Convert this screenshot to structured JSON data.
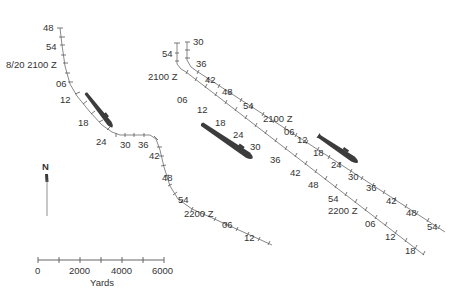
{
  "diagram": {
    "type": "navigation-track-chart",
    "compass": {
      "label": "N"
    },
    "scale_bar": {
      "ticks": [
        0,
        1000,
        2000,
        3000,
        4000,
        5000,
        6000
      ],
      "labels": [
        "0",
        "2000",
        "4000",
        "6000"
      ],
      "unit": "Yards"
    },
    "tracks": [
      {
        "id": "track-west",
        "labels": [
          "48",
          "54",
          "8/20 2100 Z",
          "06",
          "12",
          "18",
          "24",
          "30",
          "36",
          "42",
          "48",
          "54",
          "2200 Z",
          "06",
          "12"
        ]
      },
      {
        "id": "track-east-outer",
        "labels": [
          "54",
          "2100 Z",
          "06",
          "12",
          "18",
          "24",
          "30",
          "36",
          "42",
          "48",
          "54",
          "2200 Z",
          "06",
          "12",
          "18"
        ]
      },
      {
        "id": "track-east-inner",
        "labels": [
          "30",
          "36",
          "42",
          "48",
          "54",
          "2100 Z",
          "06",
          "12",
          "18",
          "24",
          "30",
          "36",
          "42",
          "48",
          "54"
        ]
      }
    ],
    "vessels": [
      {
        "id": "vessel-west",
        "type": "submarine"
      },
      {
        "id": "vessel-center",
        "type": "submarine"
      },
      {
        "id": "vessel-east",
        "type": "submarine"
      }
    ],
    "colors": {
      "track": "#7a7a7a",
      "vessel": "#3c3c3c",
      "text": "#333333"
    }
  }
}
